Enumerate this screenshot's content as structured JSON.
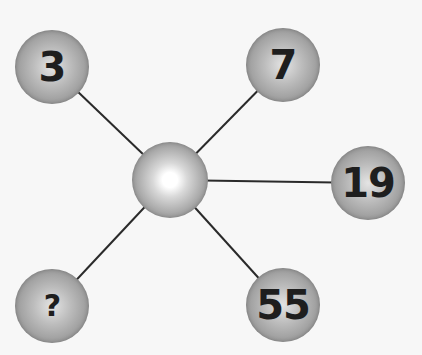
{
  "puzzle": {
    "center": {
      "x": 170,
      "y": 180,
      "label": ""
    },
    "nodes": [
      {
        "id": "top-left",
        "label": "3",
        "x": 52,
        "y": 67
      },
      {
        "id": "top-right",
        "label": "7",
        "x": 283,
        "y": 65
      },
      {
        "id": "right",
        "label": "19",
        "x": 368,
        "y": 183
      },
      {
        "id": "bottom-right",
        "label": "55",
        "x": 283,
        "y": 305
      },
      {
        "id": "bottom-left",
        "label": "?",
        "x": 52,
        "y": 306
      }
    ],
    "colors": {
      "background": "#f7f7f7",
      "line": "#2a2a2a",
      "text": "#1e1e1e"
    }
  }
}
